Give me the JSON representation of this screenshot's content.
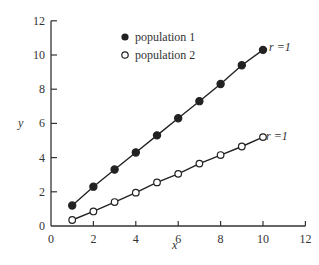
{
  "chart_data": {
    "type": "line",
    "title": "",
    "xlabel": "x",
    "ylabel": "y",
    "xlim": [
      0,
      12
    ],
    "ylim": [
      0,
      12
    ],
    "xticks": [
      0,
      2,
      4,
      6,
      8,
      10,
      12
    ],
    "yticks": [
      0,
      2,
      4,
      6,
      8,
      10,
      12
    ],
    "grid": false,
    "legend_position": "upper-left-inside",
    "x": [
      1,
      2,
      3,
      4,
      5,
      6,
      7,
      8,
      9,
      10
    ],
    "series": [
      {
        "name": "population 1",
        "marker": "filled-circle",
        "values": [
          1.2,
          2.3,
          3.3,
          4.3,
          5.3,
          6.3,
          7.3,
          8.3,
          9.4,
          10.3
        ],
        "annotation": "r =1"
      },
      {
        "name": "population 2",
        "marker": "open-circle",
        "values": [
          0.35,
          0.85,
          1.4,
          1.95,
          2.55,
          3.05,
          3.65,
          4.15,
          4.65,
          5.2
        ],
        "annotation": "r =1"
      }
    ]
  },
  "labels": {
    "xlabel": "x",
    "ylabel": "y",
    "legend1": "population 1",
    "legend2": "population 2",
    "annot1": "r =1",
    "annot2": "r =1"
  },
  "colors": {
    "axis": "#333333",
    "line": "#222222",
    "marker_fill": "#222222"
  }
}
